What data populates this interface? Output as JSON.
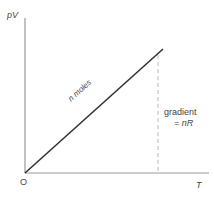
{
  "diagram": {
    "y_axis_label": "pV",
    "x_axis_label": "T",
    "origin_label": "O",
    "line_label": "n moles",
    "gradient_label_1": "gradient",
    "gradient_label_2": "= nR",
    "colors": {
      "axis": "#999999",
      "line": "#333333",
      "dashed": "#aaaaaa"
    }
  }
}
